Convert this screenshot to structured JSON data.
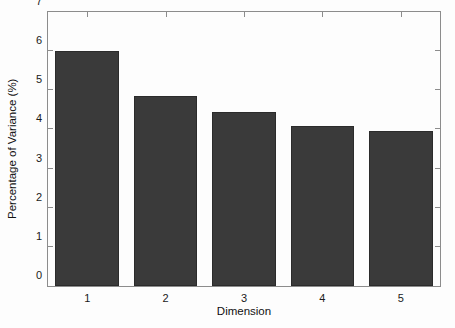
{
  "chart_data": {
    "type": "bar",
    "title": "",
    "xlabel": "Dimension",
    "ylabel": "Percentage of Variance (%)",
    "categories": [
      "1",
      "2",
      "3",
      "4",
      "5"
    ],
    "values": [
      6.0,
      4.85,
      4.45,
      4.1,
      3.95
    ],
    "series": [
      {
        "name": "Percentage of Variance",
        "values": [
          6.0,
          4.85,
          4.45,
          4.1,
          3.95
        ]
      }
    ],
    "ylim": [
      0,
      7
    ],
    "yticks": [
      0,
      1,
      2,
      3,
      4,
      5,
      6,
      7
    ],
    "ytick_labels": [
      "0",
      "1",
      "2",
      "3",
      "4",
      "5",
      "6",
      "7"
    ],
    "xtick_labels": [
      "1",
      "2",
      "3",
      "4",
      "5"
    ],
    "grid": false,
    "legend": null,
    "legend_position": "none",
    "bar_color": "#3a3a3a",
    "bar_edge_color": "#2b2b2b",
    "axis_color": "#8c8c8c",
    "background_color": "#fdfdfd",
    "text_color": "#111111",
    "annotations": []
  }
}
